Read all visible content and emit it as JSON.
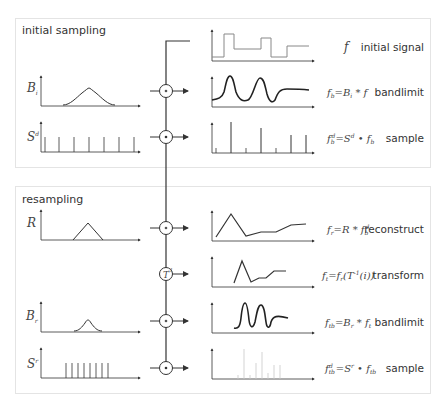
{
  "sections": {
    "initial": {
      "title": "initial sampling"
    },
    "resampling": {
      "title": "resampling"
    }
  },
  "inputs": {
    "Bi": "B",
    "Bi_sub": "i",
    "Sd": "S",
    "Sd_sup": "d",
    "R": "R",
    "Br": "B",
    "Br_sub": "r",
    "Sr": "S",
    "Sr_sup": "r"
  },
  "operators": {
    "convolve": "*",
    "multiply": "•",
    "transform": "T"
  },
  "rows": [
    {
      "formula": "f",
      "label": "initial signal"
    },
    {
      "formula": "fb = Bi * f",
      "label": "bandlimit"
    },
    {
      "formula": "fbd = Sd • fb",
      "label": "sample"
    },
    {
      "formula": "fr = R * fbd",
      "label": "reconstruct"
    },
    {
      "formula": "ft = fr(T⁻¹(i))",
      "label": "transform"
    },
    {
      "formula": "ftb = Br * ft",
      "label": "bandlimit"
    },
    {
      "formula": "ftbd = Sr • ftb",
      "label": "sample"
    }
  ],
  "colors": {
    "line": "#333333",
    "border": "#e4e4e4",
    "faint": "#c8c8c8"
  }
}
